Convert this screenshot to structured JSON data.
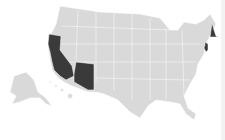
{
  "map": {
    "type": "choropleth",
    "region": "United States",
    "base_color": "#d9d9d9",
    "highlight_color": "#3a3a3a",
    "background": "#ffffff",
    "highlighted_states": [
      "California",
      "Arizona",
      "New Hampshire",
      "New Jersey"
    ],
    "insets": [
      "Alaska",
      "Hawaii"
    ]
  }
}
